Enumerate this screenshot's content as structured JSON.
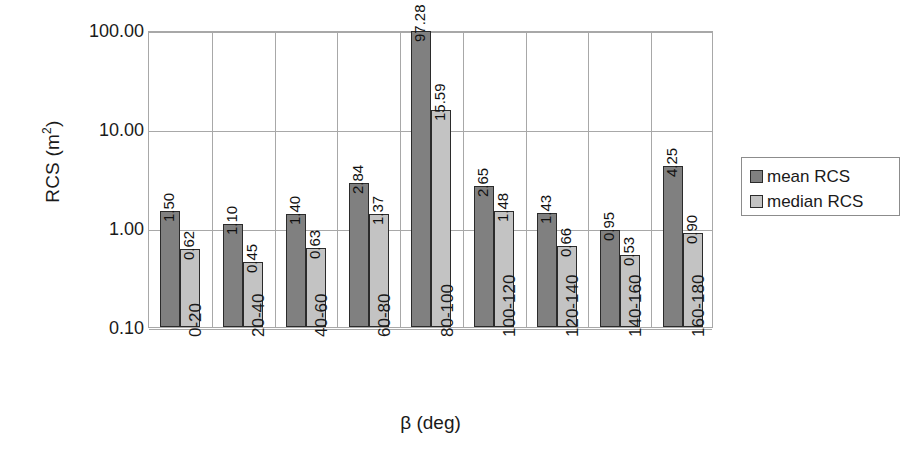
{
  "chart_data": {
    "type": "bar",
    "title": "",
    "xlabel": "β (deg)",
    "ylabel": "RCS (m²)",
    "ylabel_base": "RCS (m",
    "ylabel_exp": "2",
    "ylabel_close": ")",
    "yscale": "log",
    "ylim": [
      0.1,
      100.0
    ],
    "ytick_labels": [
      "100.00",
      "10.00",
      "1.00",
      "0.10"
    ],
    "ytick_values": [
      100.0,
      10.0,
      1.0,
      0.1
    ],
    "grid": true,
    "legend_position": "right",
    "categories": [
      "0-20",
      "20-40",
      "40-60",
      "60-80",
      "80-100",
      "100-120",
      "120-140",
      "140-160",
      "160-180"
    ],
    "series": [
      {
        "name": "mean RCS",
        "color": "#808080",
        "values": [
          1.5,
          1.1,
          1.4,
          2.84,
          97.28,
          2.65,
          1.43,
          0.95,
          4.25
        ],
        "labels": [
          "1.50",
          "1.10",
          "1.40",
          "2.84",
          "97.28",
          "2.65",
          "1.43",
          "0.95",
          "4.25"
        ]
      },
      {
        "name": "median RCS",
        "color": "#c3c3c3",
        "values": [
          0.62,
          0.45,
          0.63,
          1.37,
          15.59,
          1.48,
          0.66,
          0.53,
          0.9
        ],
        "labels": [
          "0.62",
          "0.45",
          "0.63",
          "1.37",
          "15.59",
          "1.48",
          "0.66",
          "0.53",
          "0.90"
        ]
      }
    ]
  },
  "legend": {
    "items": [
      {
        "label": "mean RCS"
      },
      {
        "label": "median RCS"
      }
    ]
  }
}
